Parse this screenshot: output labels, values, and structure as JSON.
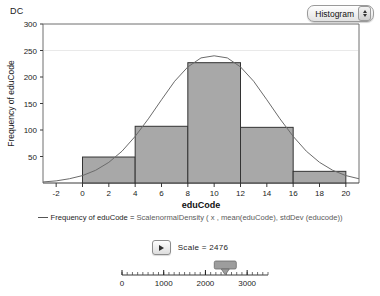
{
  "window": {
    "corner_label": "DC"
  },
  "chart_type_select": {
    "value": "Histogram",
    "up_icon": "caret-up-icon",
    "down_icon": "caret-down-icon"
  },
  "legend": {
    "marker": "line-marker",
    "text_prefix": "Frequency of eduCode = ",
    "scale_word": "Scale",
    "function": "normalDensity ( x , mean(eduCode), stdDev (educode))"
  },
  "scale_control": {
    "play_icon": "play-icon",
    "label": "Scale  =  2476",
    "value": 2476
  },
  "slider": {
    "min": 0,
    "max": 3500,
    "value": 2476,
    "tick_labels": [
      "0",
      "1000",
      "2000",
      "3000"
    ],
    "tick_values": [
      0,
      1000,
      2000,
      3000
    ],
    "thumb_icon": "slider-thumb"
  },
  "chart_data": {
    "type": "bar",
    "title": "",
    "xlabel": "eduCode",
    "ylabel": "Frequency of eduCode",
    "xlim": [
      -3,
      21
    ],
    "ylim": [
      0,
      300
    ],
    "xticks": [
      -2,
      0,
      2,
      4,
      6,
      8,
      10,
      12,
      14,
      16,
      18,
      20
    ],
    "yticks": [
      50,
      100,
      150,
      200,
      250,
      300
    ],
    "grid": false,
    "bin_width": 4,
    "bin_edges": [
      0,
      4,
      8,
      12,
      16,
      20
    ],
    "categories": [
      "0-4",
      "4-8",
      "8-12",
      "12-16",
      "16-20"
    ],
    "values": [
      49,
      107,
      227,
      105,
      22
    ],
    "bar_color": "#a8a8a8",
    "bar_edge_color": "#333333",
    "overlay": {
      "name": "normalDensity",
      "type": "line",
      "color": "#6b6b6b",
      "peak_x": 10,
      "peak_y": 240,
      "mean": 10,
      "std_dev": 3.6,
      "scale": 2476,
      "x": [
        -3,
        -2,
        -1,
        0,
        1,
        2,
        3,
        4,
        5,
        6,
        7,
        8,
        9,
        10,
        11,
        12,
        13,
        14,
        15,
        16,
        17,
        18,
        19,
        20,
        21
      ],
      "y": [
        2,
        4,
        8,
        14,
        24,
        39,
        60,
        88,
        121,
        157,
        192,
        219,
        236,
        240,
        236,
        219,
        192,
        157,
        121,
        88,
        60,
        39,
        24,
        14,
        8
      ]
    }
  }
}
